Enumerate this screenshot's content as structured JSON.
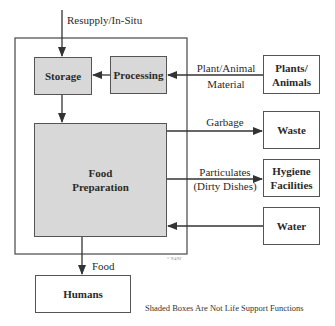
{
  "diagram": {
    "input_label": "Resupply/In-Situ",
    "boxes": {
      "storage": "Storage",
      "processing": "Processing",
      "food_preparation_line1": "Food",
      "food_preparation_line2": "Preparation",
      "plants_line1": "Plants/",
      "plants_line2": "Animals",
      "waste": "Waste",
      "hygiene_line1": "Hygiene",
      "hygiene_line2": "Facilities",
      "water": "Water",
      "humans": "Humans"
    },
    "edges": {
      "plant_material_line1": "Plant/Animal",
      "plant_material_line2": "Material",
      "garbage": "Garbage",
      "particulates_line1": "Particulates",
      "particulates_line2": "(Dirty Dishes)",
      "food": "Food"
    },
    "legend": "Shaded Boxes Are Not Life Support Functions",
    "copyright": "© 9/4/92",
    "colors": {
      "shaded_fill": "#d8d8d8",
      "line": "#444444"
    }
  }
}
